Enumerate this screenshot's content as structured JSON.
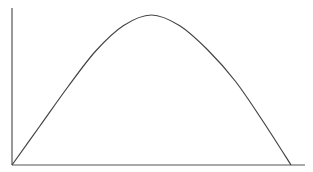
{
  "chart_data": {
    "type": "line",
    "title": "",
    "xlabel": "",
    "ylabel": "",
    "grid": false,
    "legend": null,
    "tick_labels": {
      "x": [],
      "y": []
    },
    "x": [
      0,
      0.1,
      0.2,
      0.3,
      0.4,
      0.5,
      0.6,
      0.7,
      0.8,
      0.9,
      1.0
    ],
    "series": [
      {
        "name": "curve",
        "values": [
          0,
          0.26,
          0.52,
          0.76,
          0.93,
          1.0,
          0.93,
          0.77,
          0.56,
          0.29,
          0
        ]
      }
    ],
    "xlim": [
      0,
      1.05
    ],
    "ylim": [
      0,
      1.05
    ],
    "colors": {
      "axis": "#555555",
      "curve": "#444444",
      "background": "#ffffff"
    }
  }
}
